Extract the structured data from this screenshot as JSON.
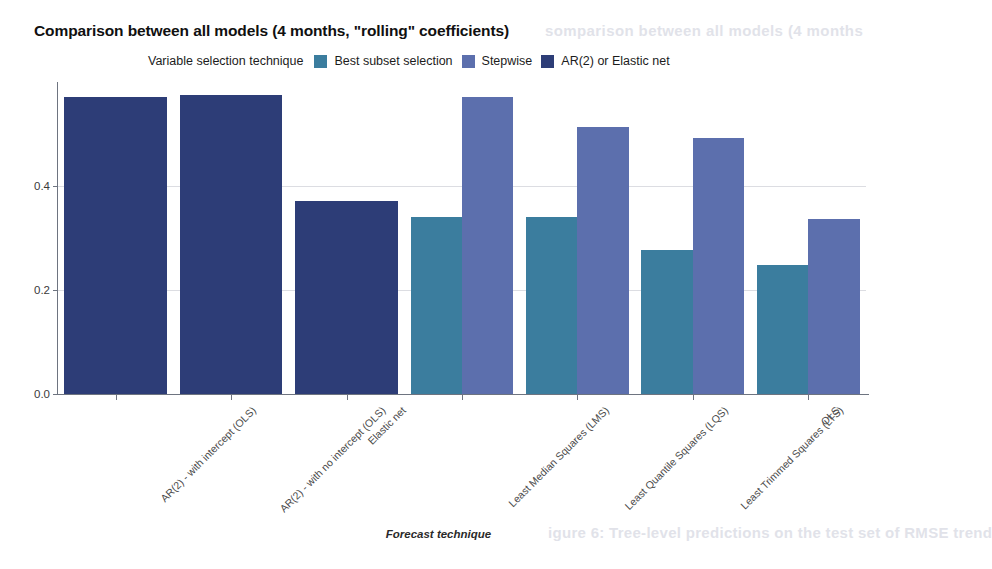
{
  "title": "Comparison between all models (4 months, \"rolling\" coefficients)",
  "legend": {
    "title": "Variable selection technique",
    "items": [
      {
        "label": "Best subset selection",
        "color": "#3b7d9e"
      },
      {
        "label": "Stepwise",
        "color": "#5c6fad"
      },
      {
        "label": "AR(2) or Elastic net",
        "color": "#2d3d77"
      }
    ]
  },
  "axes": {
    "ylabel": "RMSE (on the test set)",
    "xlabel": "Forecast technique",
    "yticks": [
      "0.0",
      "0.2",
      "0.4"
    ]
  },
  "ghost": {
    "top": "somparison between all models (4 months",
    "bottom": "igure 6: Tree-level predictions on the test set of RMSE trend"
  },
  "chart_data": {
    "type": "bar",
    "title": "Comparison between all models (4 months, \"rolling\" coefficients)",
    "xlabel": "Forecast technique",
    "ylabel": "RMSE (on the test set)",
    "ylim": [
      0.0,
      0.6
    ],
    "yticks": [
      0.0,
      0.2,
      0.4
    ],
    "grid": "horizontal",
    "legend_title": "Variable selection technique",
    "legend_position": "top",
    "categories": [
      "AR(2) - with intercept (OLS)",
      "AR(2) - with no intercept (OLS)",
      "Elastic net",
      "Least Median Squares (LMS)",
      "Least Quantile Squares (LQS)",
      "Least Trimmed Squares (LTS)",
      "OLS"
    ],
    "series": [
      {
        "name": "Best subset selection",
        "color": "#3b7d9e",
        "values": [
          null,
          null,
          null,
          0.34,
          0.34,
          0.277,
          0.249
        ]
      },
      {
        "name": "Stepwise",
        "color": "#5c6fad",
        "values": [
          null,
          null,
          null,
          0.572,
          0.513,
          0.492,
          0.336
        ]
      },
      {
        "name": "AR(2) or Elastic net",
        "color": "#2d3d77",
        "values": [
          0.571,
          0.575,
          0.372,
          null,
          null,
          null,
          null
        ]
      }
    ]
  }
}
